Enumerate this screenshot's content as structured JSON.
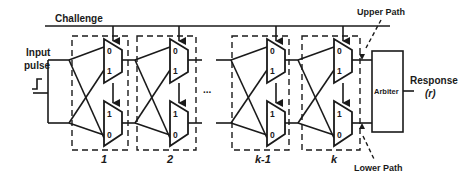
{
  "diagram": {
    "challenge_label": "Challenge",
    "input_label_line1": "Input",
    "input_label_line2": "pulse",
    "ellipsis": "...",
    "stages": [
      {
        "label": "1",
        "top_mux_pins": [
          "0",
          "1"
        ],
        "bottom_mux_pins": [
          "1",
          "0"
        ]
      },
      {
        "label": "2",
        "top_mux_pins": [
          "0",
          "1"
        ],
        "bottom_mux_pins": [
          "1",
          "0"
        ]
      },
      {
        "label": "k-1",
        "top_mux_pins": [
          "0",
          "1"
        ],
        "bottom_mux_pins": [
          "1",
          "0"
        ]
      },
      {
        "label": "k",
        "top_mux_pins": [
          "0",
          "1"
        ],
        "bottom_mux_pins": [
          "1",
          "0"
        ]
      }
    ],
    "arbiter_label": "Arbiter",
    "response_label_line1": "Response",
    "response_label_line2": "(r)",
    "upper_path_label": "Upper Path",
    "lower_path_label": "Lower Path",
    "colors": {
      "stroke": "#1a1a1a",
      "background": "#ffffff"
    }
  }
}
